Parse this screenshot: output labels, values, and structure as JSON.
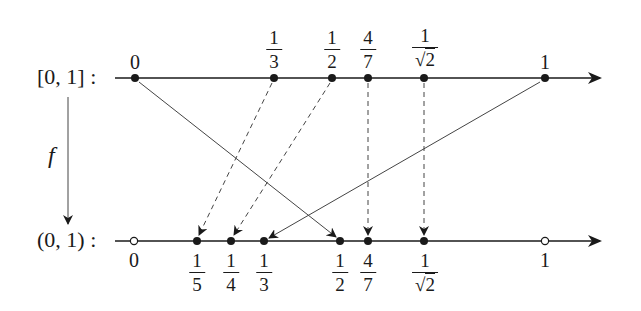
{
  "diagram": {
    "top_axis": {
      "label": "[0, 1] :",
      "points": [
        {
          "id": "0",
          "value_label": "0",
          "kind": "integer",
          "filled": true,
          "x": 135
        },
        {
          "id": "1/3",
          "num": "1",
          "den": "3",
          "kind": "fraction",
          "filled": true,
          "x": 274
        },
        {
          "id": "1/2",
          "num": "1",
          "den": "2",
          "kind": "fraction",
          "filled": true,
          "x": 332
        },
        {
          "id": "4/7",
          "num": "4",
          "den": "7",
          "kind": "fraction",
          "filled": true,
          "x": 368
        },
        {
          "id": "1/sqrt2",
          "num": "1",
          "den": "2",
          "kind": "sqrt-fraction",
          "filled": true,
          "x": 424
        },
        {
          "id": "1",
          "value_label": "1",
          "kind": "integer",
          "filled": true,
          "x": 545
        }
      ]
    },
    "bottom_axis": {
      "label": "(0, 1) :",
      "points": [
        {
          "id": "0",
          "value_label": "0",
          "kind": "integer",
          "filled": false,
          "x": 134
        },
        {
          "id": "1/5",
          "num": "1",
          "den": "5",
          "kind": "fraction",
          "filled": true,
          "x": 197
        },
        {
          "id": "1/4",
          "num": "1",
          "den": "4",
          "kind": "fraction",
          "filled": true,
          "x": 231
        },
        {
          "id": "1/3",
          "num": "1",
          "den": "3",
          "kind": "fraction",
          "filled": true,
          "x": 264
        },
        {
          "id": "1/2",
          "num": "1",
          "den": "2",
          "kind": "fraction",
          "filled": true,
          "x": 340
        },
        {
          "id": "4/7",
          "num": "4",
          "den": "7",
          "kind": "fraction",
          "filled": true,
          "x": 368
        },
        {
          "id": "1/sqrt2",
          "num": "1",
          "den": "2",
          "kind": "sqrt-fraction",
          "filled": true,
          "x": 424
        },
        {
          "id": "1",
          "value_label": "1",
          "kind": "integer",
          "filled": false,
          "x": 545
        }
      ]
    },
    "function_label": "f",
    "mappings": [
      {
        "from": "0",
        "to": "1/2",
        "style": "solid"
      },
      {
        "from": "1/3",
        "to": "1/5",
        "style": "dashed"
      },
      {
        "from": "1/2",
        "to": "1/4",
        "style": "dashed"
      },
      {
        "from": "4/7",
        "to": "4/7",
        "style": "dashed"
      },
      {
        "from": "1/sqrt2",
        "to": "1/sqrt2",
        "style": "dashed"
      },
      {
        "from": "1",
        "to": "1/3",
        "style": "solid"
      }
    ],
    "colors": {
      "ink": "#1a1a1a",
      "line": "#333333",
      "background": "#ffffff"
    }
  },
  "labels": {
    "top_axis_label": "[0, 1] :",
    "bottom_axis_label": "(0, 1) :",
    "function": "f",
    "top": {
      "zero": "0",
      "one_third_num": "1",
      "one_third_den": "3",
      "one_half_num": "1",
      "one_half_den": "2",
      "four_sevenths_num": "4",
      "four_sevenths_den": "7",
      "inv_sqrt2_num": "1",
      "inv_sqrt2_den": "2",
      "one": "1"
    },
    "bottom": {
      "zero": "0",
      "one_fifth_num": "1",
      "one_fifth_den": "5",
      "one_fourth_num": "1",
      "one_fourth_den": "4",
      "one_third_num": "1",
      "one_third_den": "3",
      "one_half_num": "1",
      "one_half_den": "2",
      "four_sevenths_num": "4",
      "four_sevenths_den": "7",
      "inv_sqrt2_num": "1",
      "inv_sqrt2_den": "2",
      "one": "1"
    },
    "sqrt_symbol": "√"
  }
}
